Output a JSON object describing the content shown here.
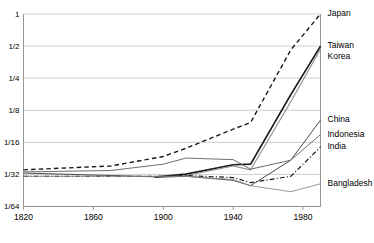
{
  "chart_data": {
    "type": "line",
    "title": "",
    "subtitle": "",
    "xlabel": "",
    "ylabel": "",
    "xlim": [
      1820,
      1990
    ],
    "ylim_fraction": [
      0.015625,
      1
    ],
    "y_scale": "log2",
    "grid": true,
    "legend_position": "right-inline-labels",
    "x_ticks": [
      1820,
      1860,
      1900,
      1940,
      1980
    ],
    "x_tick_labels": [
      "1820",
      "1860",
      "1900",
      "1940",
      "1980"
    ],
    "y_ticks": [
      1,
      0.5,
      0.25,
      0.125,
      0.0625,
      0.03125,
      0.015625
    ],
    "y_tick_labels": [
      "1",
      "1/2",
      "1/4",
      "1/8",
      "1/16",
      "1/32",
      "1/64"
    ],
    "series": [
      {
        "name": "Japan",
        "label": "Japan",
        "style": "dashed",
        "color": "#1a1a1a",
        "width": 1.4,
        "x": [
          1820,
          1870,
          1900,
          1913,
          1940,
          1950,
          1973,
          1990
        ],
        "values": [
          0.0345,
          0.0375,
          0.046,
          0.055,
          0.083,
          0.096,
          0.46,
          1.0
        ]
      },
      {
        "name": "Taiwan",
        "label": "Taiwan",
        "style": "solid",
        "color": "#1a1a1a",
        "width": 1.7,
        "x": [
          1895,
          1913,
          1940,
          1950,
          1973,
          1990
        ],
        "values": [
          0.0295,
          0.0315,
          0.0385,
          0.039,
          0.175,
          0.5
        ]
      },
      {
        "name": "Korea",
        "label": "Korea",
        "style": "solid",
        "color": "#8c8c8c",
        "width": 1.1,
        "x": [
          1911,
          1940,
          1950,
          1973,
          1990
        ],
        "values": [
          0.03,
          0.0375,
          0.0345,
          0.15,
          0.47
        ]
      },
      {
        "name": "China",
        "label": "China",
        "style": "solid",
        "color": "#4a4a4a",
        "width": 1.0,
        "x": [
          1820,
          1870,
          1900,
          1913,
          1940,
          1950,
          1973,
          1990
        ],
        "values": [
          0.0322,
          0.0305,
          0.0295,
          0.03,
          0.0275,
          0.0245,
          0.0425,
          0.101
        ]
      },
      {
        "name": "Indonesia",
        "label": "Indonesia",
        "style": "solid",
        "color": "#6e6e6e",
        "width": 1.0,
        "x": [
          1820,
          1870,
          1900,
          1913,
          1940,
          1950,
          1973,
          1990
        ],
        "values": [
          0.033,
          0.034,
          0.039,
          0.0445,
          0.043,
          0.035,
          0.0425,
          0.074
        ]
      },
      {
        "name": "India",
        "label": "India",
        "style": "dash-dot",
        "color": "#1a1a1a",
        "width": 1.2,
        "x": [
          1820,
          1870,
          1900,
          1913,
          1940,
          1950,
          1973,
          1990
        ],
        "values": [
          0.03,
          0.03,
          0.03,
          0.0305,
          0.0292,
          0.0262,
          0.03,
          0.0565
        ]
      },
      {
        "name": "Bangladesh",
        "label": "Bangladesh",
        "style": "solid",
        "color": "#8c8c8c",
        "width": 0.9,
        "x": [
          1820,
          1870,
          1900,
          1913,
          1940,
          1950,
          1973,
          1990
        ],
        "values": [
          0.03,
          0.03,
          0.03,
          0.03,
          0.028,
          0.0245,
          0.0215,
          0.0255
        ]
      }
    ],
    "series_labels_right": [
      {
        "text": "Japan",
        "at_value": 1.0
      },
      {
        "text": "Taiwan",
        "at_value": 0.5
      },
      {
        "text": "Korea",
        "at_value": 0.4
      },
      {
        "text": "China",
        "at_value": 0.101
      },
      {
        "text": "Indonesia",
        "at_value": 0.074
      },
      {
        "text": "India",
        "at_value": 0.0565
      },
      {
        "text": "Bangladesh",
        "at_value": 0.0255
      }
    ]
  }
}
